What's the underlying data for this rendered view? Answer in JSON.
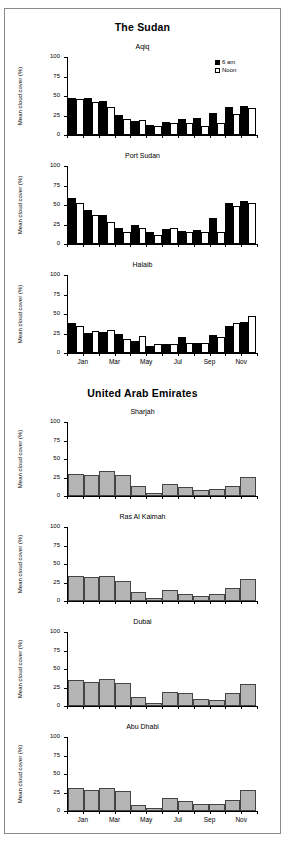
{
  "sections": [
    {
      "title": "The Sudan"
    },
    {
      "title": "United Arab Emirates"
    }
  ],
  "axis": {
    "ylabel": "Mean cloud cover (%)",
    "yticks": [
      "100",
      "75",
      "50",
      "25",
      "0"
    ],
    "xticks": [
      "Jan",
      "Mar",
      "May",
      "Jul",
      "Sep",
      "Nov"
    ]
  },
  "legend": {
    "series1": "6 am",
    "series2": "Noon"
  },
  "titles": {
    "aqiq": "Aqiq",
    "port_sudan": "Port Sudan",
    "halaib": "Halaib",
    "sharjah": "Sharjah",
    "ras_al_kaimah": "Ras Al Kaimah",
    "dubai": "Dubai",
    "abu_dhabi": "Abu Dhabi"
  },
  "chart_data": [
    {
      "type": "bar",
      "title": "Aqiq",
      "group": "The Sudan",
      "categories": [
        "Jan",
        "Feb",
        "Mar",
        "Apr",
        "May",
        "Jun",
        "Jul",
        "Aug",
        "Sep",
        "Oct",
        "Nov",
        "Dec"
      ],
      "series": [
        {
          "name": "6 am",
          "values": [
            47,
            47,
            43,
            26,
            18,
            13,
            17,
            20,
            22,
            28,
            36,
            37
          ]
        },
        {
          "name": "Noon",
          "values": [
            46,
            42,
            36,
            20,
            19,
            11,
            16,
            15,
            12,
            15,
            27,
            34
          ]
        }
      ],
      "xlabel": "",
      "ylabel": "Mean cloud cover (%)",
      "ylim": [
        0,
        100
      ],
      "grid": false,
      "legend_position": "top-right"
    },
    {
      "type": "bar",
      "title": "Port Sudan",
      "group": "The Sudan",
      "categories": [
        "Jan",
        "Feb",
        "Mar",
        "Apr",
        "May",
        "Jun",
        "Jul",
        "Aug",
        "Sep",
        "Oct",
        "Nov",
        "Dec"
      ],
      "series": [
        {
          "name": "6 am",
          "values": [
            59,
            44,
            37,
            20,
            24,
            16,
            19,
            17,
            18,
            33,
            52,
            55
          ]
        },
        {
          "name": "Noon",
          "values": [
            52,
            37,
            28,
            15,
            20,
            12,
            21,
            16,
            15,
            16,
            49,
            53
          ]
        }
      ],
      "xlabel": "",
      "ylabel": "Mean cloud cover (%)",
      "ylim": [
        0,
        100
      ],
      "grid": false,
      "legend_position": "none"
    },
    {
      "type": "bar",
      "title": "Halaib",
      "group": "The Sudan",
      "categories": [
        "Jan",
        "Feb",
        "Mar",
        "Apr",
        "May",
        "Jun",
        "Jul",
        "Aug",
        "Sep",
        "Oct",
        "Nov",
        "Dec"
      ],
      "series": [
        {
          "name": "6 am",
          "values": [
            38,
            26,
            27,
            24,
            15,
            9,
            12,
            21,
            13,
            23,
            35,
            40
          ]
        },
        {
          "name": "Noon",
          "values": [
            34,
            28,
            30,
            18,
            22,
            11,
            11,
            13,
            13,
            20,
            38,
            48
          ]
        }
      ],
      "xlabel": "",
      "ylabel": "Mean cloud cover (%)",
      "ylim": [
        0,
        100
      ],
      "grid": false,
      "legend_position": "none"
    },
    {
      "type": "bar",
      "title": "Sharjah",
      "group": "United Arab Emirates",
      "categories": [
        "Jan",
        "Feb",
        "Mar",
        "Apr",
        "May",
        "Jun",
        "Jul",
        "Aug",
        "Sep",
        "Oct",
        "Nov",
        "Dec"
      ],
      "series": [
        {
          "name": "Mean cloud cover",
          "values": [
            30,
            28,
            34,
            28,
            13,
            4,
            16,
            12,
            8,
            9,
            14,
            26
          ]
        }
      ],
      "xlabel": "",
      "ylabel": "Mean cloud cover (%)",
      "ylim": [
        0,
        100
      ],
      "grid": false,
      "legend_position": "none"
    },
    {
      "type": "bar",
      "title": "Ras Al Kaimah",
      "group": "United Arab Emirates",
      "categories": [
        "Jan",
        "Feb",
        "Mar",
        "Apr",
        "May",
        "Jun",
        "Jul",
        "Aug",
        "Sep",
        "Oct",
        "Nov",
        "Dec"
      ],
      "series": [
        {
          "name": "Mean cloud cover",
          "values": [
            34,
            32,
            34,
            27,
            12,
            4,
            15,
            9,
            7,
            9,
            17,
            30
          ]
        }
      ],
      "xlabel": "",
      "ylabel": "Mean cloud cover (%)",
      "ylim": [
        0,
        100
      ],
      "grid": false,
      "legend_position": "none"
    },
    {
      "type": "bar",
      "title": "Dubai",
      "group": "United Arab Emirates",
      "categories": [
        "Jan",
        "Feb",
        "Mar",
        "Apr",
        "May",
        "Jun",
        "Jul",
        "Aug",
        "Sep",
        "Oct",
        "Nov",
        "Dec"
      ],
      "series": [
        {
          "name": "Mean cloud cover",
          "values": [
            35,
            33,
            37,
            31,
            12,
            4,
            19,
            17,
            9,
            8,
            17,
            30
          ]
        }
      ],
      "xlabel": "",
      "ylabel": "Mean cloud cover (%)",
      "ylim": [
        0,
        100
      ],
      "grid": false,
      "legend_position": "none"
    },
    {
      "type": "bar",
      "title": "Abu Dhabi",
      "group": "United Arab Emirates",
      "categories": [
        "Jan",
        "Feb",
        "Mar",
        "Apr",
        "May",
        "Jun",
        "Jul",
        "Aug",
        "Sep",
        "Oct",
        "Nov",
        "Dec"
      ],
      "series": [
        {
          "name": "Mean cloud cover",
          "values": [
            31,
            29,
            31,
            27,
            8,
            4,
            17,
            14,
            10,
            9,
            15,
            28
          ]
        }
      ],
      "xlabel": "",
      "ylabel": "Mean cloud cover (%)",
      "ylim": [
        0,
        100
      ],
      "grid": false,
      "legend_position": "none"
    }
  ]
}
